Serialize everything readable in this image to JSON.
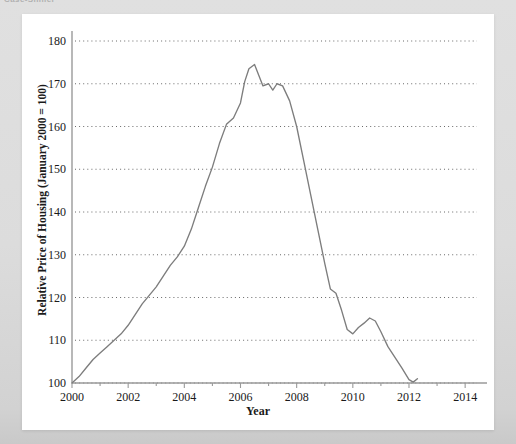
{
  "page": {
    "clipped_header_text": "Case-Shiller",
    "background_color": "#dcdcdc",
    "card_color": "#ffffff"
  },
  "chart_data": {
    "type": "line",
    "title": "",
    "xlabel": "Year",
    "ylabel": "Relative Price of Housing (January 2000 = 100)",
    "xlim": [
      2000,
      2014.6
    ],
    "ylim": [
      100,
      180
    ],
    "grid": true,
    "grid_style": "dotted-horizontal",
    "legend": "none",
    "line_color": "#7d7d7d",
    "axis_color": "#9a9a9a",
    "xticks": [
      2000,
      2002,
      2004,
      2006,
      2008,
      2010,
      2012,
      2014
    ],
    "xtick_labels": [
      "2000",
      "2002",
      "2004",
      "2006",
      "2008",
      "2010",
      "2012",
      "2014"
    ],
    "xminor_ticks": [
      2001,
      2003,
      2005,
      2007,
      2009,
      2011,
      2013
    ],
    "yticks": [
      100,
      110,
      120,
      130,
      140,
      150,
      160,
      170,
      180
    ],
    "ytick_labels": [
      "100",
      "110",
      "120",
      "130",
      "140",
      "150",
      "160",
      "170",
      "180"
    ],
    "series": [
      {
        "name": "Relative Price of Housing",
        "x": [
          2000.0,
          2000.25,
          2000.5,
          2000.75,
          2001.0,
          2001.25,
          2001.5,
          2001.75,
          2002.0,
          2002.25,
          2002.5,
          2002.75,
          2003.0,
          2003.25,
          2003.5,
          2003.75,
          2004.0,
          2004.25,
          2004.5,
          2004.75,
          2005.0,
          2005.25,
          2005.5,
          2005.75,
          2006.0,
          2006.15,
          2006.3,
          2006.5,
          2006.65,
          2006.8,
          2007.0,
          2007.15,
          2007.3,
          2007.5,
          2007.75,
          2008.0,
          2008.25,
          2008.5,
          2008.75,
          2009.0,
          2009.2,
          2009.4,
          2009.6,
          2009.8,
          2010.0,
          2010.2,
          2010.4,
          2010.6,
          2010.8,
          2011.0,
          2011.25,
          2011.5,
          2011.75,
          2012.0,
          2012.15,
          2012.3
        ],
        "values": [
          100.0,
          101.5,
          103.5,
          105.5,
          107.0,
          108.5,
          110.0,
          111.5,
          113.5,
          116.0,
          118.5,
          120.5,
          122.5,
          125.0,
          127.5,
          129.5,
          132.0,
          136.0,
          141.0,
          146.0,
          150.5,
          156.0,
          160.5,
          162.0,
          165.5,
          170.5,
          173.5,
          174.5,
          172.0,
          169.5,
          170.0,
          168.5,
          170.0,
          169.5,
          166.0,
          160.0,
          152.0,
          144.0,
          136.0,
          128.0,
          122.0,
          121.0,
          117.0,
          112.5,
          111.5,
          113.0,
          114.0,
          115.2,
          114.5,
          112.0,
          108.5,
          106.0,
          103.5,
          100.8,
          100.2,
          101.0
        ]
      }
    ]
  }
}
